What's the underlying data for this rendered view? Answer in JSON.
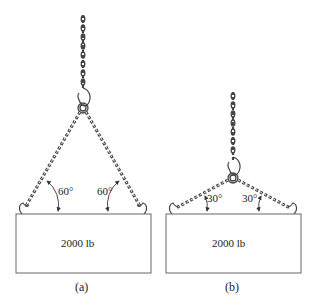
{
  "figure": {
    "panels": [
      {
        "id": "a",
        "caption": "(a)",
        "load_label": "2000 lb",
        "angle_left": "60°",
        "angle_right": "60°"
      },
      {
        "id": "b",
        "caption": "(b)",
        "load_label": "2000 lb",
        "angle_left": "30°",
        "angle_right": "30°"
      }
    ],
    "icons": [
      "chain-icon",
      "hook-icon",
      "ring-icon",
      "angle-arrow-icon"
    ],
    "colors": {
      "line": "#555555",
      "chain": "#444444",
      "text": "#222222",
      "background": "#ffffff"
    }
  }
}
